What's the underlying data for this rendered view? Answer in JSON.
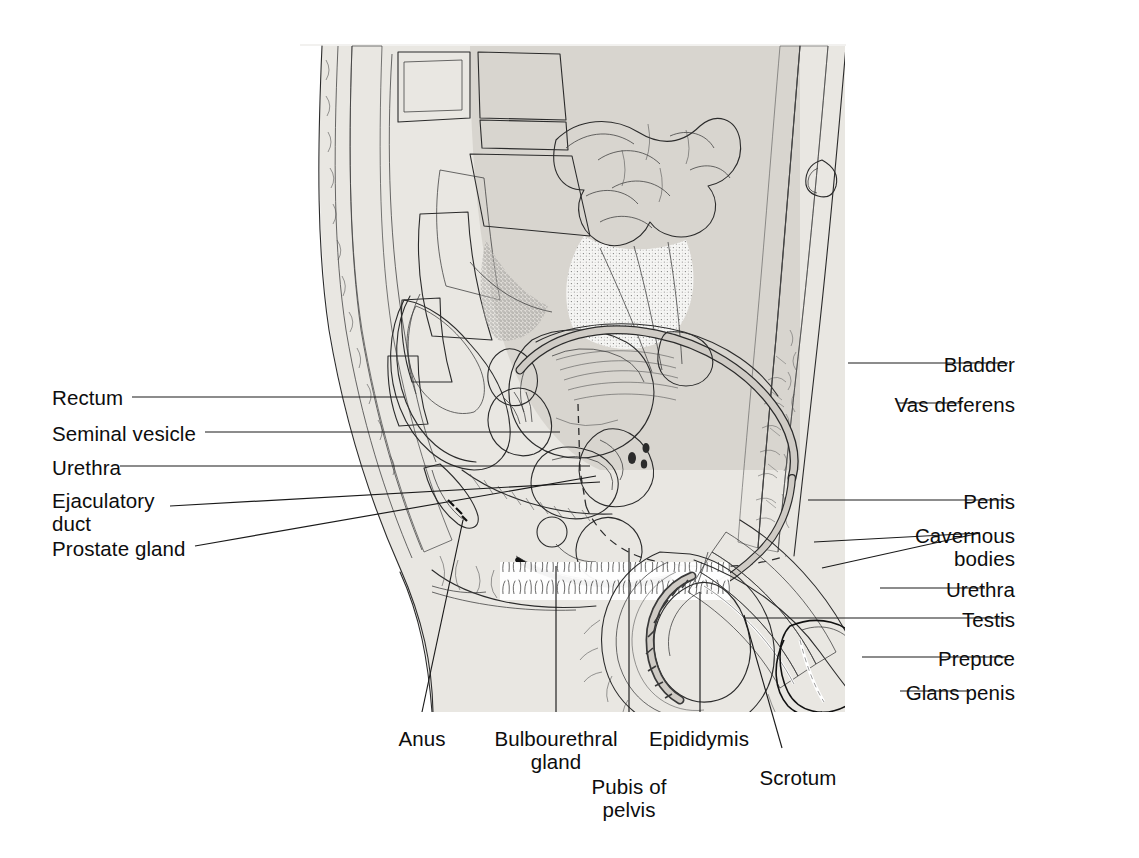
{
  "figure": {
    "type": "anatomical-illustration",
    "background_color": "#ffffff",
    "ink_color": "#2b2b2b",
    "tone_light": "#eceae6",
    "tone_mid": "#d9d6d1",
    "tone_dark": "#b9b5ae"
  },
  "labels_left": [
    {
      "id": "rectum",
      "text": "Rectum",
      "text2": "",
      "x": 52,
      "y": 386
    },
    {
      "id": "seminal-vesicle",
      "text": "Seminal  vesicle",
      "text2": "",
      "x": 52,
      "y": 422
    },
    {
      "id": "urethra-left",
      "text": "Urethra",
      "text2": "",
      "x": 52,
      "y": 456
    },
    {
      "id": "ejaculatory-duct",
      "text": "Ejaculatory",
      "text2": "duct",
      "x": 52,
      "y": 489
    },
    {
      "id": "prostate-gland",
      "text": "Prostate gland",
      "text2": "",
      "x": 52,
      "y": 537
    }
  ],
  "labels_right": [
    {
      "id": "bladder",
      "text": "Bladder",
      "text2": "",
      "right": 1015,
      "y": 353
    },
    {
      "id": "vas-deferens",
      "text": "Vas deferens",
      "text2": "",
      "right": 1015,
      "y": 393
    },
    {
      "id": "penis",
      "text": "Penis",
      "text2": "",
      "right": 1015,
      "y": 490
    },
    {
      "id": "cavernous-bodies",
      "text": "Cavernous",
      "text2": "bodies",
      "right": 1015,
      "y": 524
    },
    {
      "id": "urethra-right",
      "text": "Urethra",
      "text2": "",
      "right": 1015,
      "y": 578
    },
    {
      "id": "testis",
      "text": "Testis",
      "text2": "",
      "right": 1015,
      "y": 608
    },
    {
      "id": "prepuce",
      "text": "Prepuce",
      "text2": "",
      "right": 1015,
      "y": 647
    },
    {
      "id": "glans-penis",
      "text": "Glans penis",
      "text2": "",
      "right": 1015,
      "y": 681
    }
  ],
  "labels_bottom": [
    {
      "id": "anus",
      "text": "Anus",
      "text2": "",
      "cx": 422,
      "y": 727
    },
    {
      "id": "bulbourethral-gland",
      "text": "Bulbourethral",
      "text2": "gland",
      "cx": 556,
      "y": 727
    },
    {
      "id": "epididymis",
      "text": "Epididymis",
      "text2": "",
      "cx": 699,
      "y": 727
    },
    {
      "id": "pubis-of-pelvis",
      "text": "Pubis of",
      "text2": "pelvis",
      "cx": 629,
      "y": 775
    },
    {
      "id": "scrotum",
      "text": "Scrotum",
      "text2": "",
      "cx": 798,
      "y": 766
    }
  ],
  "leaders": [
    {
      "id": "leader-rectum",
      "d": "M 132 397 L 404 397"
    },
    {
      "id": "leader-seminal-vesicle",
      "d": "M 205 432 L 560 432"
    },
    {
      "id": "leader-urethra-left",
      "d": "M 120 466 L 590 466"
    },
    {
      "id": "leader-ejaculatory-duct",
      "d": "M 170 506 L 600 482"
    },
    {
      "id": "leader-prostate-gland",
      "d": "M 195 546 L 596 476"
    },
    {
      "id": "leader-bladder",
      "d": "M 848 363 L 1008 363"
    },
    {
      "id": "leader-vas-deferens",
      "d": "M 898 403 L 962 403"
    },
    {
      "id": "leader-penis",
      "d": "M 808 500 L 1008 500"
    },
    {
      "id": "leader-cavernous-a",
      "d": "M 814 542 L 980 533"
    },
    {
      "id": "leader-cavernous-b",
      "d": "M 822 568 L 980 533"
    },
    {
      "id": "leader-urethra-right",
      "d": "M 880 588 L 985 588"
    },
    {
      "id": "leader-testis",
      "d": "M 745 618 L 1008 618"
    },
    {
      "id": "leader-prepuce",
      "d": "M 862 657 L 1008 657"
    },
    {
      "id": "leader-glans-penis",
      "d": "M 900 691 L 970 691"
    },
    {
      "id": "leader-anus",
      "d": "M 422 712 L 463 520"
    },
    {
      "id": "leader-bulbourethral",
      "d": "M 556 712 L 556 566"
    },
    {
      "id": "leader-epididymis",
      "d": "M 700 712 L 700 592"
    },
    {
      "id": "leader-pubis",
      "d": "M 629 712 L 629 548"
    },
    {
      "id": "leader-scrotum",
      "d": "M 782 748 L 744 615"
    }
  ]
}
